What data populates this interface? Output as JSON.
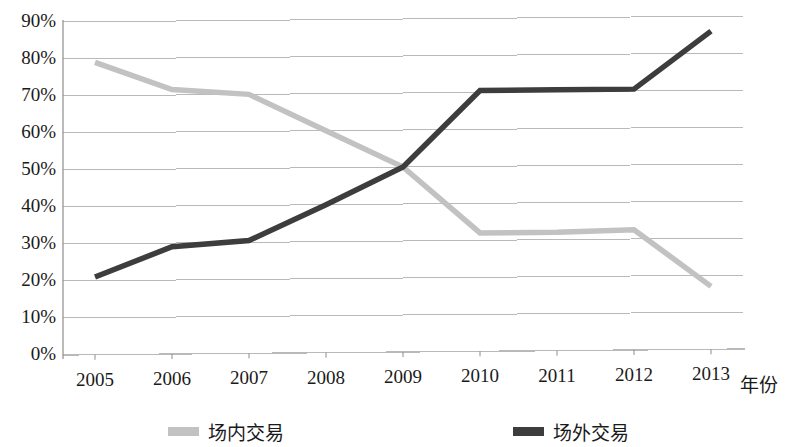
{
  "chart_data": {
    "type": "line",
    "title": "",
    "xlabel": "年份",
    "ylabel": "",
    "categories": [
      "2005",
      "2006",
      "2007",
      "2008",
      "2009",
      "2010",
      "2011",
      "2012",
      "2013"
    ],
    "ytick_labels": [
      "90%",
      "80%",
      "70%",
      "60%",
      "50%",
      "40%",
      "30%",
      "20%",
      "10%",
      "0%"
    ],
    "ytick_values": [
      90,
      80,
      70,
      60,
      50,
      40,
      30,
      20,
      10,
      0
    ],
    "ylim": [
      0,
      90
    ],
    "grid": true,
    "legend_position": "bottom",
    "series": [
      {
        "name": "场内交易",
        "color": "#c2c2c2",
        "values": [
          79,
          71.5,
          70,
          60,
          50,
          32,
          32,
          32.5,
          17
        ]
      },
      {
        "name": "场外交易",
        "color": "#3d3d3d",
        "values": [
          21,
          29,
          30.5,
          40,
          50,
          70.5,
          70.5,
          70.5,
          86
        ]
      }
    ]
  },
  "legend": {
    "items": [
      {
        "label": "场内交易",
        "color": "#c2c2c2"
      },
      {
        "label": "场外交易",
        "color": "#3d3d3d"
      }
    ]
  },
  "axes": {
    "x_axis_title": "年份"
  },
  "colors": {
    "grid": "#b9b9b9",
    "axis": "#8c8c8c",
    "text": "#1a1a1a",
    "series_light": "#c2c2c2",
    "series_dark": "#3d3d3d"
  }
}
